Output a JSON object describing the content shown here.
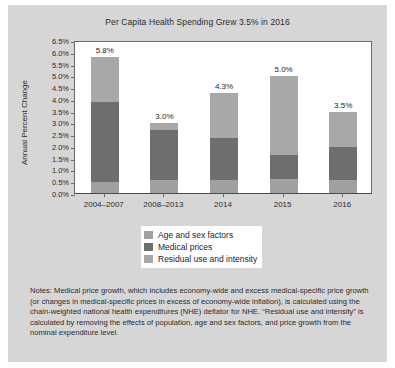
{
  "chart_data": {
    "type": "bar",
    "stacked": true,
    "title": "Per Capita Health Spending Grew 3.5% in 2016",
    "xlabel": "",
    "ylabel": "Annual Percent Change",
    "ylim": [
      0,
      6.5
    ],
    "ytick_step": 0.5,
    "grid": false,
    "legend_position": "below-plot-center",
    "categories": [
      "2004–2007",
      "2008–2013",
      "2014",
      "2015",
      "2016"
    ],
    "ytick_labels": [
      "0.0%",
      "0.5%",
      "1.0%",
      "1.5%",
      "2.0%",
      "2.5%",
      "3.0%",
      "3.5%",
      "4.0%",
      "4.5%",
      "5.0%",
      "5.5%",
      "6.0%",
      "6.5%"
    ],
    "ytick_values": [
      0,
      0.5,
      1.0,
      1.5,
      2.0,
      2.5,
      3.0,
      3.5,
      4.0,
      4.5,
      5.0,
      5.5,
      6.0,
      6.5
    ],
    "series": [
      {
        "name": "Age and sex factors",
        "color": "#a0a0a0",
        "values": [
          0.5,
          0.6,
          0.6,
          0.65,
          0.6
        ]
      },
      {
        "name": "Medical prices",
        "color": "#6e6e6e",
        "values": [
          3.4,
          2.1,
          1.8,
          1.0,
          1.4
        ]
      },
      {
        "name": "Residual use and intensity",
        "color": "#a8a8a8",
        "values": [
          1.9,
          0.3,
          1.9,
          3.35,
          1.5
        ]
      }
    ],
    "totals": [
      5.8,
      3.0,
      4.3,
      5.0,
      3.5
    ],
    "data_labels": [
      "5.8%",
      "3.0%",
      "4.3%",
      "5.0%",
      "3.5%"
    ],
    "annotations": []
  },
  "legend": {
    "items": [
      {
        "label": "Age and sex factors",
        "color": "#a0a0a0"
      },
      {
        "label": "Medical prices",
        "color": "#6e6e6e"
      },
      {
        "label": "Residual use and intensity",
        "color": "#a8a8a8"
      }
    ]
  },
  "notes": {
    "text": "Notes: Medical price growth, which includes economy-wide and excess medical-specific price growth (or changes in medical-specific prices in excess of economy-wide inflation), is calculated using the chain-weighted national health expenditures (NHE) deflator for NHE. “Residual use and intensity” is calculated by removing the effects of population, age and sex factors, and price growth from the nominal expenditure level."
  },
  "colors": {
    "card_background": "#d6d6d6",
    "plot_background": "#ffffff",
    "axis": "#6b6b6b",
    "text": "#2b2b2b"
  }
}
